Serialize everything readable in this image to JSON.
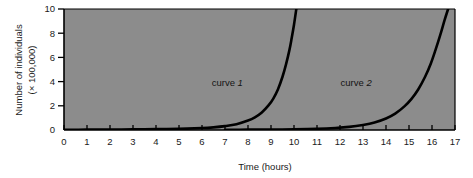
{
  "chart_data": {
    "type": "line",
    "title": "",
    "xlabel": "Time (hours)",
    "ylabel": "Number of individuals (× 100,000)",
    "ylabel_line1": "Number of individuals",
    "ylabel_line2": "(× 100,000)",
    "xlim": [
      0,
      17
    ],
    "ylim": [
      0,
      10
    ],
    "xticks": [
      0,
      1,
      2,
      3,
      4,
      5,
      6,
      7,
      8,
      9,
      10,
      11,
      12,
      13,
      14,
      15,
      16,
      17
    ],
    "yticks": [
      0,
      2,
      4,
      6,
      8,
      10
    ],
    "xtick_labels": [
      "0",
      "1",
      "2",
      "3",
      "4",
      "5",
      "6",
      "7",
      "8",
      "9",
      "10",
      "11",
      "12",
      "13",
      "14",
      "15",
      "16",
      "17"
    ],
    "ytick_labels": [
      "0",
      "2",
      "4",
      "6",
      "8",
      "10"
    ],
    "grid": false,
    "legend_position": "inline-annotations",
    "plot_background": "#8c8c8c",
    "line_color": "#000000",
    "line_width": 2.6,
    "series": [
      {
        "name": "curve 1",
        "label": "curve",
        "label_number": "1",
        "label_x": 7.1,
        "label_y": 3.6,
        "points": [
          {
            "x": 0.0,
            "y": 0.02
          },
          {
            "x": 1.0,
            "y": 0.03
          },
          {
            "x": 2.0,
            "y": 0.04
          },
          {
            "x": 3.0,
            "y": 0.05
          },
          {
            "x": 4.0,
            "y": 0.07
          },
          {
            "x": 5.0,
            "y": 0.1
          },
          {
            "x": 6.0,
            "y": 0.16
          },
          {
            "x": 6.5,
            "y": 0.22
          },
          {
            "x": 7.0,
            "y": 0.32
          },
          {
            "x": 7.5,
            "y": 0.48
          },
          {
            "x": 8.0,
            "y": 0.78
          },
          {
            "x": 8.3,
            "y": 1.05
          },
          {
            "x": 8.6,
            "y": 1.45
          },
          {
            "x": 8.9,
            "y": 2.05
          },
          {
            "x": 9.1,
            "y": 2.6
          },
          {
            "x": 9.3,
            "y": 3.35
          },
          {
            "x": 9.5,
            "y": 4.4
          },
          {
            "x": 9.65,
            "y": 5.4
          },
          {
            "x": 9.8,
            "y": 6.6
          },
          {
            "x": 9.9,
            "y": 7.6
          },
          {
            "x": 10.0,
            "y": 8.7
          },
          {
            "x": 10.1,
            "y": 10.0
          }
        ]
      },
      {
        "name": "curve 2",
        "label": "curve",
        "label_number": "2",
        "label_x": 12.7,
        "label_y": 3.6,
        "points": [
          {
            "x": 7.0,
            "y": 0.02
          },
          {
            "x": 8.0,
            "y": 0.03
          },
          {
            "x": 9.0,
            "y": 0.04
          },
          {
            "x": 10.0,
            "y": 0.06
          },
          {
            "x": 11.0,
            "y": 0.1
          },
          {
            "x": 11.8,
            "y": 0.17
          },
          {
            "x": 12.4,
            "y": 0.26
          },
          {
            "x": 13.0,
            "y": 0.42
          },
          {
            "x": 13.5,
            "y": 0.62
          },
          {
            "x": 14.0,
            "y": 0.95
          },
          {
            "x": 14.4,
            "y": 1.35
          },
          {
            "x": 14.8,
            "y": 1.95
          },
          {
            "x": 15.1,
            "y": 2.55
          },
          {
            "x": 15.4,
            "y": 3.35
          },
          {
            "x": 15.7,
            "y": 4.4
          },
          {
            "x": 15.95,
            "y": 5.5
          },
          {
            "x": 16.15,
            "y": 6.6
          },
          {
            "x": 16.35,
            "y": 7.8
          },
          {
            "x": 16.55,
            "y": 9.1
          },
          {
            "x": 16.7,
            "y": 10.0
          }
        ]
      }
    ]
  }
}
